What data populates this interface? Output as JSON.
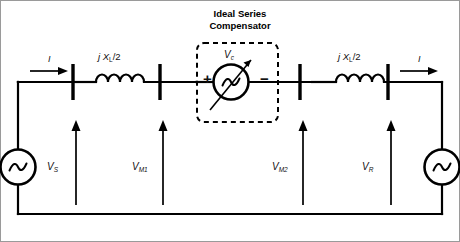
{
  "diagram": {
    "kind": "power-system-single-line-diagram",
    "title": "Ideal Series Compensator",
    "title_line1": "Ideal Series",
    "title_line2": "Compensator",
    "background_color": "#ffffff",
    "line_color": "#000000"
  },
  "labels": {
    "current_left": "I",
    "current_right": "I",
    "impedance_left_prefix": "j X",
    "impedance_left_sub": "L",
    "impedance_left_suffix": "/2",
    "impedance_right_prefix": "j X",
    "impedance_right_sub": "L",
    "impedance_right_suffix": "/2",
    "v_source": "V",
    "v_source_sub": "S",
    "v_mid1": "V",
    "v_mid1_sub": "M1",
    "v_mid2": "V",
    "v_mid2_sub": "M2",
    "v_receiving": "V",
    "v_receiving_sub": "R",
    "v_comp": "V",
    "v_comp_sub": "c",
    "polarity_plus": "+",
    "polarity_minus": "−"
  },
  "components": {
    "sending_source": "ac-voltage-source",
    "receiving_source": "ac-voltage-source",
    "compensator_source": "controllable-ac-voltage-source",
    "inductor_left": "inductor-coil",
    "inductor_right": "inductor-coil",
    "buses": [
      "bus-bar-1",
      "bus-bar-2",
      "bus-bar-3",
      "bus-bar-4"
    ],
    "compensator_boundary": "dashed-box"
  }
}
